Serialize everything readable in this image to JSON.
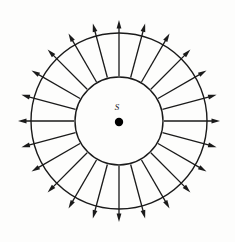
{
  "figure": {
    "type": "radial-vector-field",
    "background_color": "#fdfdfc",
    "ink_color": "#1a1a1a",
    "width": 235,
    "height": 242
  },
  "source": {
    "label": "S",
    "label_x": 117,
    "label_y": 108,
    "label_font_size": 9,
    "dot_x": 119,
    "dot_y": 122,
    "dot_radius": 4.2,
    "dot_color": "#000000"
  },
  "geometry": {
    "center_x": 119,
    "center_y": 121,
    "inner_circle_radius": 44,
    "outer_circle_radius": 88,
    "inner_circle_stroke_width": 1.4,
    "outer_circle_stroke_width": 1.4,
    "arrow_count": 24,
    "arrow_angle_step_deg": 15,
    "arrow_start_radius": 45,
    "arrow_end_radius": 101,
    "arrow_shaft_width": 1.3,
    "arrow_head_length": 8.5,
    "arrow_head_half_width": 2.4,
    "arrow_start_angle_deg": -90
  },
  "chart_data": {
    "type": "scatter",
    "title": "",
    "xlabel": "",
    "ylabel": "",
    "series": [
      {
        "name": "field-arrows",
        "note": "24 radial arrows evenly spaced every 15 degrees, directed outward from the source",
        "angles_deg": [
          0,
          15,
          30,
          45,
          60,
          75,
          90,
          105,
          120,
          135,
          150,
          165,
          180,
          195,
          210,
          225,
          240,
          255,
          270,
          285,
          300,
          315,
          330,
          345
        ],
        "start_radius": 45,
        "end_radius": 101
      },
      {
        "name": "inner-circle",
        "note": "Gaussian surface closest to the source",
        "radius": 44
      },
      {
        "name": "outer-circle",
        "note": "Outer Gaussian surface",
        "radius": 88
      }
    ]
  }
}
